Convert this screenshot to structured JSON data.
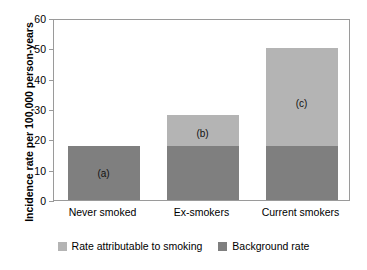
{
  "chart_data": {
    "type": "bar",
    "subtype": "stacked-bar",
    "title": "",
    "xlabel": "",
    "ylabel": "Incidence rate per 100,000 person-years",
    "ylim": [
      0,
      60
    ],
    "yticks": [
      0,
      10,
      20,
      30,
      40,
      50,
      60
    ],
    "ytick_labels": [
      "0",
      "10",
      "20",
      "30",
      "40",
      "50",
      "60"
    ],
    "grid": false,
    "legend_position": "bottom",
    "categories": [
      "Never smoked",
      "Ex-smokers",
      "Current smokers"
    ],
    "series": [
      {
        "name": "Background rate",
        "color": "#7f7f7f",
        "values": [
          17.8,
          17.8,
          17.8
        ]
      },
      {
        "name": "Rate attributable to smoking",
        "color": "#b4b4b4",
        "values": [
          0,
          10.2,
          32.2
        ]
      }
    ],
    "totals": [
      17.8,
      28.0,
      50.0
    ],
    "annotations": [
      {
        "text": "(a)",
        "category": "Never smoked"
      },
      {
        "text": "(b)",
        "category": "Ex-smokers"
      },
      {
        "text": "(c)",
        "category": "Current smokers"
      }
    ]
  },
  "legend": {
    "entries": [
      {
        "label": "Rate attributable to smoking",
        "color": "#b4b4b4"
      },
      {
        "label": "Background rate",
        "color": "#7f7f7f"
      }
    ]
  }
}
